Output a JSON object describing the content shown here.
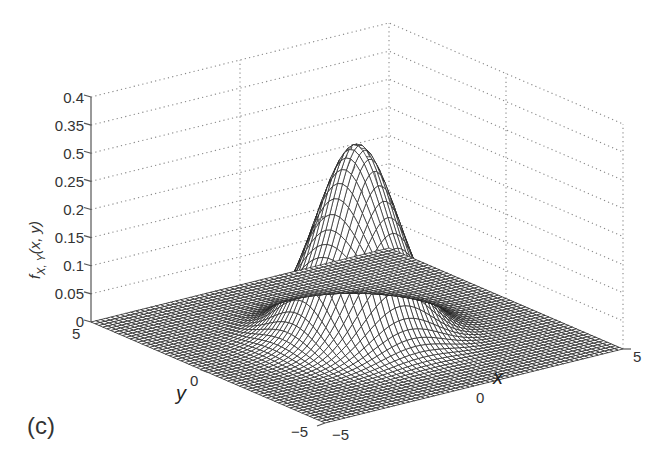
{
  "panel_label": "(c)",
  "axes": {
    "zlabel": "f",
    "zlabel_sub": "X, Y",
    "zlabel_args": "(x, y)",
    "xlabel": "x",
    "ylabel": "y",
    "z_ticks": [
      "0",
      "0.05",
      "0.1",
      "0.15",
      "0.2",
      "0.25",
      "0.5",
      "0.35",
      "0.4"
    ],
    "x_ticks": [
      "−5",
      "0",
      "5"
    ],
    "y_ticks": [
      "−5",
      "0",
      "5"
    ]
  },
  "colors": {
    "surface_dark": "#1a1a1a",
    "mesh_line": "#222222",
    "grid": "#888888",
    "text": "#333333"
  },
  "chart_data": {
    "type": "surface",
    "title": "",
    "xlabel": "x",
    "ylabel": "y",
    "zlabel": "f_{X,Y}(x, y)",
    "xlim": [
      -5,
      5
    ],
    "ylim": [
      -5,
      5
    ],
    "zlim": [
      0,
      0.4
    ],
    "x_ticks": [
      -5,
      0,
      5
    ],
    "y_ticks": [
      -5,
      0,
      5
    ],
    "z_ticks": [
      0,
      0.05,
      0.1,
      0.15,
      0.2,
      0.25,
      0.3,
      0.35,
      0.4
    ],
    "z_tick_labels": [
      "0",
      "0.05",
      "0.1",
      "0.15",
      "0.2",
      "0.25",
      "0.5",
      "0.35",
      "0.4"
    ],
    "peak": {
      "x": 0,
      "y": 0,
      "z": 0.34
    },
    "distribution": "approx. standard bivariate normal (sigma≈1.1), peak≈0.34",
    "grid": true,
    "legend": null,
    "annotations": [
      "(c)"
    ]
  }
}
